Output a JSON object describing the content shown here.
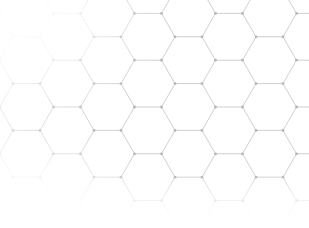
{
  "canvas": {
    "width": 309,
    "height": 228,
    "background_color": "#ffffff",
    "title": "Hexagonal Lattice Pattern"
  },
  "pattern": {
    "name": "honeycomb-hexagonal-lattice",
    "orientation": "flat-top",
    "line_color": "#c9c9cf",
    "line_width": 0.9,
    "node_color": "#b4b4bc",
    "node_radius": 1.4,
    "hex_radius": 27,
    "column_pitch": 40.5,
    "row_pitch": 46.8,
    "column_offset": 23.4,
    "origin_x": -14,
    "origin_y": -10,
    "columns": 10,
    "rows": 7,
    "description": "Light gray honeycomb grid of flat-top hexagons with small dot nodes at each vertex, fading to white at the upper-left and lower portions of the frame"
  },
  "fades": [
    {
      "name": "top-left-washout",
      "corner": "top-left"
    },
    {
      "name": "bottom-blank-strip",
      "corner": "bottom"
    },
    {
      "name": "bottom-left-washout",
      "corner": "bottom-left"
    },
    {
      "name": "left-edge-softening",
      "corner": "left"
    }
  ]
}
